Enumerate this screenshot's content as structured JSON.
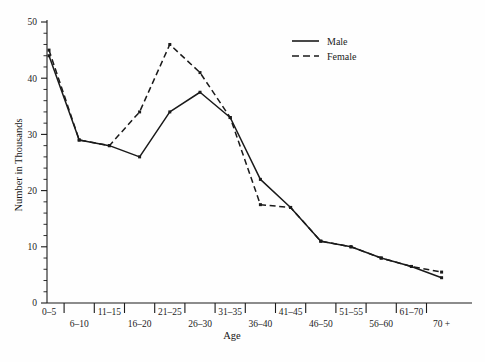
{
  "chart_data": {
    "type": "line",
    "title": "",
    "xlabel": "Age",
    "ylabel": "Number in Thousands",
    "categories": [
      "0–5",
      "6–10",
      "11–15",
      "16–20",
      "21–25",
      "26–30",
      "31–35",
      "36–40",
      "41–45",
      "46–50",
      "51–55",
      "56–60",
      "61–70",
      "70 +"
    ],
    "series": [
      {
        "name": "Male",
        "style": "solid",
        "values": [
          44,
          29,
          28,
          26,
          34,
          37.5,
          33,
          22,
          17,
          11,
          10,
          8,
          6.5,
          4.5
        ]
      },
      {
        "name": "Female",
        "style": "dashed",
        "values": [
          45,
          29,
          28,
          34,
          46,
          41,
          33,
          17.5,
          17,
          11,
          10,
          8,
          6.5,
          5.5
        ]
      }
    ],
    "ylim": [
      0,
      50
    ],
    "yticks": [
      0,
      10,
      20,
      30,
      40,
      50
    ],
    "yticklabels": [
      "0",
      "10",
      "20",
      "30",
      "40",
      "50"
    ],
    "minor_ticks": true,
    "grid": false,
    "legend_position": "top-right"
  },
  "axes": {
    "y_title": "Number in Thousands",
    "x_title": "Age"
  },
  "legend": {
    "entries": [
      {
        "label": "Male",
        "dash": "none"
      },
      {
        "label": "Female",
        "dash": "dashed"
      }
    ]
  },
  "colors": {
    "line": "#1a1a1a",
    "axis": "#1a1a1a",
    "text": "#1b1b1b",
    "background": "#fefefe"
  }
}
